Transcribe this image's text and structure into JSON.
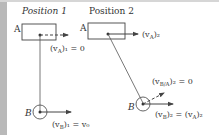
{
  "figure": {
    "position1": {
      "heading": "Position 1",
      "label_A": "A",
      "label_B": "B",
      "vA_label": "(v",
      "vA_sub": "A",
      "vA_tail": ")₁ = 0",
      "vB_label": "(v",
      "vB_sub": "B",
      "vB_tail": ")₁ = v₀"
    },
    "position2": {
      "heading": "Position 2",
      "label_A": "A",
      "label_B": "B",
      "vA_label": "(v",
      "vA_sub": "A",
      "vA_tail": ")₂",
      "vBA_label": "(v",
      "vBA_sub": "B/A",
      "vBA_tail": ")₂ = 0",
      "vB_label": "(v",
      "vB_sub": "B",
      "vB_mid": ")₂ = (v",
      "vB_sub2": "A",
      "vB_tail": ")₂"
    },
    "colors": {
      "line": "#444444",
      "text": "#333333",
      "edge": "#b9b9b9"
    }
  }
}
